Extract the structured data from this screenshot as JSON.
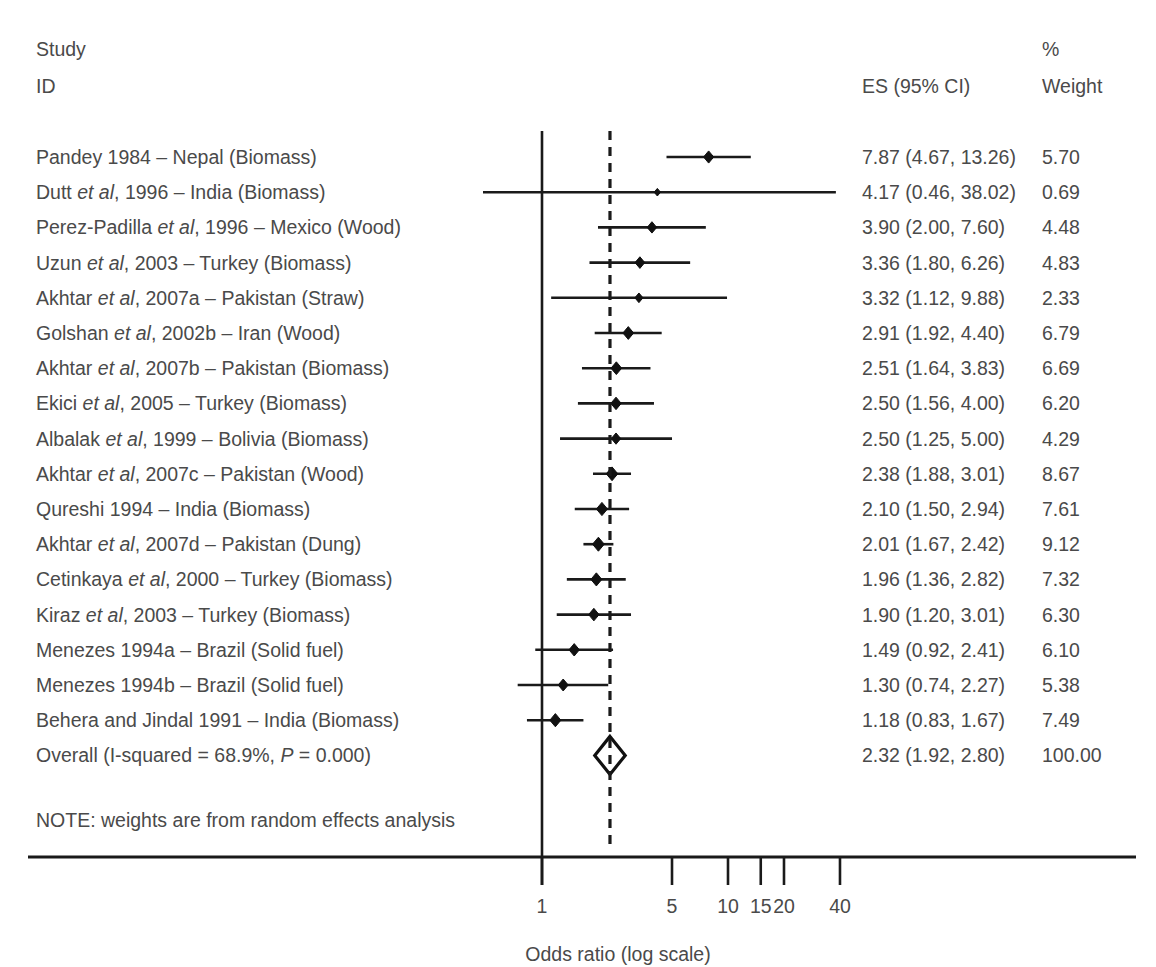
{
  "header": {
    "study_line1": "Study",
    "study_line2": "ID",
    "es_header": "ES (95% CI)",
    "weight_line1": "%",
    "weight_line2": "Weight"
  },
  "note": "NOTE: weights are from random effects analysis",
  "axis": {
    "title": "Odds ratio (log scale)",
    "ticks": [
      "1",
      "5",
      "10",
      "15",
      "20",
      "40"
    ]
  },
  "colors": {
    "text": "#4a4a4a",
    "line": "#1a1a1a",
    "marker": "#111111"
  },
  "chart_data": {
    "type": "forest",
    "title": "",
    "xlabel": "Odds ratio (log scale)",
    "ylabel": "",
    "xscale": "log",
    "xlim": [
      0.35,
      45
    ],
    "xticks": [
      1,
      5,
      10,
      15,
      20,
      40
    ],
    "xtick_labels": [
      "1",
      "5",
      "10",
      "15",
      "20",
      "40"
    ],
    "null_line": 1,
    "pooled_line": 2.32,
    "grid": false,
    "legend": "none",
    "columns": [
      "Study ID",
      "ES (95% CI)",
      "% Weight"
    ],
    "note": "NOTE: weights are from random effects analysis",
    "rows": [
      {
        "label_pre": "Pandey 1984 ",
        "label_ital": "",
        "label_post": "– Nepal (Biomass)",
        "es": 7.87,
        "lo": 4.67,
        "hi": 13.26,
        "es_text": "7.87 (4.67, 13.26)",
        "weight": 5.7,
        "weight_text": "5.70"
      },
      {
        "label_pre": "Dutt ",
        "label_ital": "et al",
        "label_post": ", 1996 – India (Biomass)",
        "es": 4.17,
        "lo": 0.46,
        "hi": 38.02,
        "es_text": "4.17 (0.46, 38.02)",
        "weight": 0.69,
        "weight_text": "0.69"
      },
      {
        "label_pre": "Perez-Padilla ",
        "label_ital": "et al",
        "label_post": ", 1996 – Mexico (Wood)",
        "es": 3.9,
        "lo": 2.0,
        "hi": 7.6,
        "es_text": "3.90 (2.00, 7.60)",
        "weight": 4.48,
        "weight_text": "4.48"
      },
      {
        "label_pre": "Uzun ",
        "label_ital": "et al",
        "label_post": ", 2003 – Turkey (Biomass)",
        "es": 3.36,
        "lo": 1.8,
        "hi": 6.26,
        "es_text": "3.36 (1.80, 6.26)",
        "weight": 4.83,
        "weight_text": "4.83"
      },
      {
        "label_pre": "Akhtar ",
        "label_ital": "et al",
        "label_post": ", 2007a – Pakistan (Straw)",
        "es": 3.32,
        "lo": 1.12,
        "hi": 9.88,
        "es_text": "3.32 (1.12, 9.88)",
        "weight": 2.33,
        "weight_text": "2.33"
      },
      {
        "label_pre": "Golshan ",
        "label_ital": "et al",
        "label_post": ", 2002b – Iran (Wood)",
        "es": 2.91,
        "lo": 1.92,
        "hi": 4.4,
        "es_text": "2.91 (1.92, 4.40)",
        "weight": 6.79,
        "weight_text": "6.79"
      },
      {
        "label_pre": "Akhtar ",
        "label_ital": "et al",
        "label_post": ", 2007b – Pakistan (Biomass)",
        "es": 2.51,
        "lo": 1.64,
        "hi": 3.83,
        "es_text": "2.51 (1.64, 3.83)",
        "weight": 6.69,
        "weight_text": "6.69"
      },
      {
        "label_pre": "Ekici ",
        "label_ital": "et al",
        "label_post": ", 2005 – Turkey (Biomass)",
        "es": 2.5,
        "lo": 1.56,
        "hi": 4.0,
        "es_text": "2.50 (1.56, 4.00)",
        "weight": 6.2,
        "weight_text": "6.20"
      },
      {
        "label_pre": "Albalak ",
        "label_ital": "et al",
        "label_post": ", 1999 – Bolivia (Biomass)",
        "es": 2.5,
        "lo": 1.25,
        "hi": 5.0,
        "es_text": "2.50 (1.25, 5.00)",
        "weight": 4.29,
        "weight_text": "4.29"
      },
      {
        "label_pre": "Akhtar ",
        "label_ital": "et al",
        "label_post": ", 2007c – Pakistan (Wood)",
        "es": 2.38,
        "lo": 1.88,
        "hi": 3.01,
        "es_text": "2.38 (1.88, 3.01)",
        "weight": 8.67,
        "weight_text": "8.67"
      },
      {
        "label_pre": "Qureshi 1994 ",
        "label_ital": "",
        "label_post": "– India (Biomass)",
        "es": 2.1,
        "lo": 1.5,
        "hi": 2.94,
        "es_text": "2.10 (1.50, 2.94)",
        "weight": 7.61,
        "weight_text": "7.61"
      },
      {
        "label_pre": "Akhtar ",
        "label_ital": "et al",
        "label_post": ", 2007d – Pakistan (Dung)",
        "es": 2.01,
        "lo": 1.67,
        "hi": 2.42,
        "es_text": "2.01 (1.67, 2.42)",
        "weight": 9.12,
        "weight_text": "9.12"
      },
      {
        "label_pre": "Cetinkaya ",
        "label_ital": "et al",
        "label_post": ", 2000 – Turkey (Biomass)",
        "es": 1.96,
        "lo": 1.36,
        "hi": 2.82,
        "es_text": "1.96 (1.36, 2.82)",
        "weight": 7.32,
        "weight_text": "7.32"
      },
      {
        "label_pre": "Kiraz ",
        "label_ital": "et al",
        "label_post": ", 2003 – Turkey (Biomass)",
        "es": 1.9,
        "lo": 1.2,
        "hi": 3.01,
        "es_text": "1.90 (1.20, 3.01)",
        "weight": 6.3,
        "weight_text": "6.30"
      },
      {
        "label_pre": "Menezes 1994a ",
        "label_ital": "",
        "label_post": "– Brazil (Solid fuel)",
        "es": 1.49,
        "lo": 0.92,
        "hi": 2.41,
        "es_text": "1.49 (0.92, 2.41)",
        "weight": 6.1,
        "weight_text": "6.10"
      },
      {
        "label_pre": "Menezes 1994b ",
        "label_ital": "",
        "label_post": "– Brazil (Solid fuel)",
        "es": 1.3,
        "lo": 0.74,
        "hi": 2.27,
        "es_text": "1.30 (0.74, 2.27)",
        "weight": 5.38,
        "weight_text": "5.38"
      },
      {
        "label_pre": "Behera and Jindal 1991 ",
        "label_ital": "",
        "label_post": "– India (Biomass)",
        "es": 1.18,
        "lo": 0.83,
        "hi": 1.67,
        "es_text": "1.18 (0.83, 1.67)",
        "weight": 7.49,
        "weight_text": "7.49"
      }
    ],
    "overall": {
      "label_pre": "Overall (I-squared = 68.9%, ",
      "label_ital": "P",
      "label_post": " = 0.000)",
      "es": 2.32,
      "lo": 1.92,
      "hi": 2.8,
      "es_text": "2.32 (1.92, 2.80)",
      "weight": 100.0,
      "weight_text": "100.00"
    }
  }
}
